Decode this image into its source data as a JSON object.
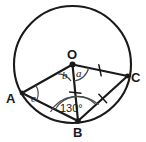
{
  "figure": {
    "type": "circle-geometry-diagram",
    "stroke_color": "#1a1a1a",
    "fill_color": "#ffffff",
    "circle": {
      "cx": 72.5,
      "cy": 64.5,
      "r": 58.5
    },
    "center_label": "O",
    "vertices": [
      {
        "name": "A",
        "label": "A",
        "x": 22.0,
        "y": 93.0,
        "label_x": 6,
        "label_y": 92
      },
      {
        "name": "B",
        "label": "B",
        "x": 78.0,
        "y": 121.0,
        "label_x": 73,
        "label_y": 126
      },
      {
        "name": "C",
        "label": "C",
        "x": 127.5,
        "y": 76.0,
        "label_x": 131,
        "label_y": 71
      }
    ],
    "center_point": {
      "x": 72.5,
      "y": 64.5,
      "label_x": 67,
      "label_y": 48
    },
    "segments": [
      {
        "name": "radius-OA",
        "from": "O",
        "to": "A",
        "ticks": 0
      },
      {
        "name": "radius-OB",
        "from": "O",
        "to": "B",
        "ticks": 1
      },
      {
        "name": "radius-OC",
        "from": "O",
        "to": "C",
        "ticks": 1
      },
      {
        "name": "chord-AB",
        "from": "A",
        "to": "B",
        "ticks": 0
      },
      {
        "name": "chord-BC",
        "from": "B",
        "to": "C",
        "ticks": 1
      }
    ],
    "angles": [
      {
        "name": "angle-a",
        "label": "a",
        "vertex": "O",
        "between": [
          "B",
          "C"
        ],
        "label_x": 76,
        "label_y": 68
      },
      {
        "name": "angle-b",
        "label": "b",
        "vertex": "O",
        "between": [
          "A",
          "B"
        ],
        "label_x": 62,
        "label_y": 70
      },
      {
        "name": "angle-c",
        "label": "c",
        "vertex": "A",
        "between": [
          "O",
          "B"
        ],
        "label_x": 31,
        "label_y": 93
      },
      {
        "name": "angle-130",
        "label": "130°",
        "vertex": "B",
        "between": [
          "A",
          "C"
        ],
        "label_x": 60,
        "label_y": 103
      }
    ]
  }
}
